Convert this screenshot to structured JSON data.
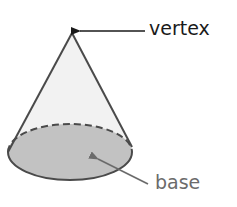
{
  "diagram": {
    "shape": "cone",
    "labels": {
      "vertex": "vertex",
      "base": "base"
    },
    "colors": {
      "outline": "#4a4a4a",
      "lateral_fill": "#f2f2f2",
      "base_fill": "#c2c2c2",
      "vertex_text": "#1a1a1a",
      "base_text": "#6b6b6b",
      "vertex_arrow": "#1a1a1a",
      "base_arrow": "#6b6b6b"
    }
  }
}
